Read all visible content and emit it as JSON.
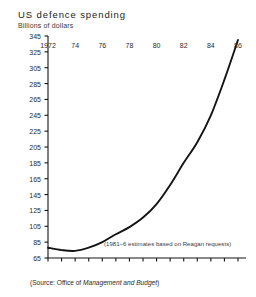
{
  "chart_data": {
    "type": "line",
    "title": "US defence spending",
    "subtitle": "Billions of dollars",
    "ylabel": "Billions of dollars",
    "xlabel": "",
    "ylim": [
      65,
      345
    ],
    "xlim": [
      1972,
      1986
    ],
    "grid": false,
    "legend": false,
    "y_ticks": [
      65,
      85,
      105,
      125,
      145,
      165,
      185,
      205,
      225,
      245,
      265,
      285,
      305,
      325,
      345
    ],
    "x_ticks": [
      1972,
      1973,
      1974,
      1975,
      1976,
      1977,
      1978,
      1979,
      1980,
      1981,
      1982,
      1983,
      1984,
      1985,
      1986
    ],
    "x_tick_labels": [
      "1972",
      "",
      "74",
      "",
      "76",
      "",
      "78",
      "",
      "80",
      "",
      "82",
      "",
      "84",
      "",
      "86"
    ],
    "x": [
      1972,
      1973,
      1974,
      1975,
      1976,
      1977,
      1978,
      1979,
      1980,
      1981,
      1982,
      1983,
      1984,
      1985,
      1986
    ],
    "values": [
      78,
      75,
      74,
      78,
      85,
      95,
      104,
      116,
      133,
      157,
      185,
      211,
      245,
      290,
      340
    ],
    "series_name": "US defence spending",
    "annotation": "(1981–6 estimates based on Reagan requests)",
    "source_prefix": "(Source: Office of ",
    "source_italic": "Management and Budget",
    "source_suffix": ")",
    "line_color": "#141414"
  }
}
